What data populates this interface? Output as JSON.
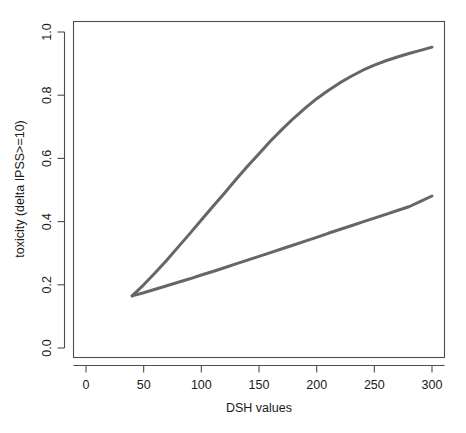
{
  "chart_data": {
    "type": "line",
    "title": "",
    "xlabel": "DSH values",
    "ylabel": "toxicity (delta IPSS>=10)",
    "xlim": [
      -10,
      312
    ],
    "ylim": [
      -0.04,
      1.04
    ],
    "xticks": [
      0,
      50,
      100,
      150,
      200,
      250,
      300
    ],
    "xtick_labels": [
      "0",
      "50",
      "100",
      "150",
      "200",
      "250",
      "300"
    ],
    "yticks": [
      0.0,
      0.2,
      0.4,
      0.6,
      0.8,
      1.0
    ],
    "ytick_labels": [
      "0.0",
      "0.2",
      "0.4",
      "0.6",
      "0.8",
      "1.0"
    ],
    "grid": false,
    "legend": "none",
    "line_color": "#666666",
    "line_width": 3.0,
    "series": [
      {
        "name": "upper-curve",
        "x": [
          40,
          50,
          60,
          70,
          80,
          90,
          100,
          110,
          120,
          130,
          140,
          150,
          160,
          170,
          180,
          190,
          200,
          210,
          220,
          230,
          240,
          250,
          260,
          270,
          280,
          290,
          300
        ],
        "values": [
          0.165,
          0.2,
          0.238,
          0.278,
          0.32,
          0.362,
          0.405,
          0.448,
          0.49,
          0.533,
          0.575,
          0.615,
          0.655,
          0.692,
          0.727,
          0.759,
          0.789,
          0.815,
          0.839,
          0.86,
          0.879,
          0.895,
          0.909,
          0.921,
          0.932,
          0.942,
          0.952
        ]
      },
      {
        "name": "lower-curve",
        "x": [
          40,
          50,
          60,
          70,
          80,
          90,
          100,
          110,
          120,
          130,
          140,
          150,
          160,
          170,
          180,
          190,
          200,
          210,
          220,
          230,
          240,
          250,
          260,
          270,
          280,
          290,
          300
        ],
        "values": [
          0.165,
          0.175,
          0.186,
          0.197,
          0.208,
          0.219,
          0.231,
          0.242,
          0.254,
          0.266,
          0.278,
          0.29,
          0.302,
          0.314,
          0.326,
          0.338,
          0.35,
          0.363,
          0.375,
          0.387,
          0.399,
          0.411,
          0.423,
          0.435,
          0.447,
          0.464,
          0.481
        ]
      }
    ]
  },
  "figure": {
    "background": "#ffffff",
    "axis_color": "#4d4d4d",
    "text_color": "#1a1a1a"
  }
}
